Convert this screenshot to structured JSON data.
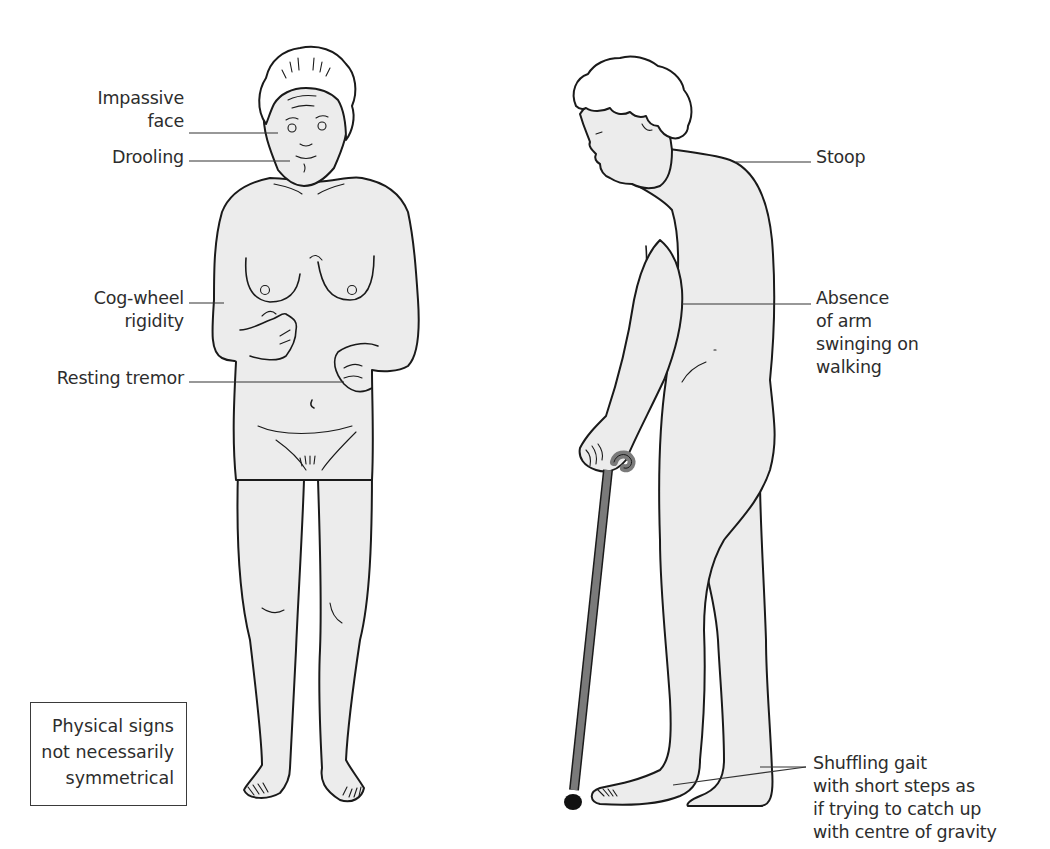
{
  "figure": {
    "colors": {
      "skin": "#ececec",
      "outline": "#1a1a1a",
      "leader_line": "#333333",
      "cane": "#7a7a7a",
      "cane_tip": "#111111",
      "text": "#2d2d2d",
      "background": "#ffffff"
    }
  },
  "front_view": {
    "labels": [
      {
        "id": "impassive-face",
        "lines": [
          "Impassive",
          "face"
        ]
      },
      {
        "id": "drooling",
        "lines": [
          "Drooling"
        ]
      },
      {
        "id": "cog-wheel-rigidity",
        "lines": [
          "Cog-wheel",
          "rigidity"
        ]
      },
      {
        "id": "resting-tremor",
        "lines": [
          "Resting tremor"
        ]
      }
    ]
  },
  "side_view": {
    "labels": [
      {
        "id": "stoop",
        "lines": [
          "Stoop"
        ]
      },
      {
        "id": "absence-arm-swing",
        "lines": [
          "Absence",
          "of arm",
          "swinging on",
          "walking"
        ]
      },
      {
        "id": "shuffling-gait",
        "lines": [
          "Shuffling gait",
          "with short steps as",
          "if trying to catch up",
          "with centre of gravity"
        ]
      }
    ]
  },
  "note": {
    "text": "Physical signs\nnot necessarily\nsymmetrical"
  }
}
